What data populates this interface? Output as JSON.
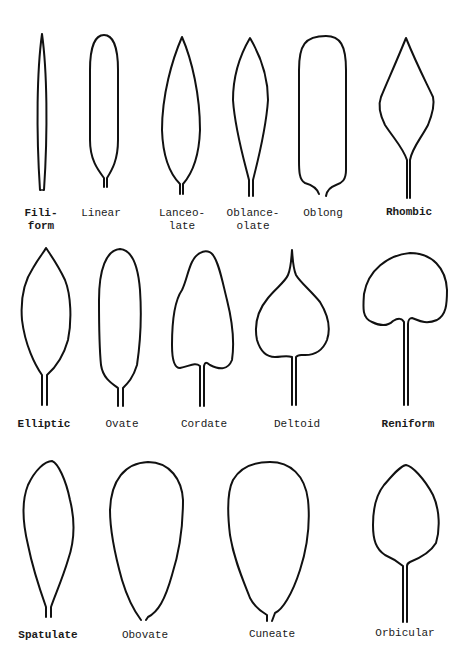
{
  "figure": {
    "rows": [
      {
        "leaves": [
          {
            "name": "Filiform",
            "label": "Fili-\nform"
          },
          {
            "name": "Linear",
            "label": "Linear"
          },
          {
            "name": "Lanceolate",
            "label": "Lanceo-\nlate"
          },
          {
            "name": "Oblanceolate",
            "label": "Oblance-\nolate"
          },
          {
            "name": "Oblong",
            "label": "Oblong"
          },
          {
            "name": "Rhombic",
            "label": "Rhombic"
          }
        ]
      },
      {
        "leaves": [
          {
            "name": "Elliptic",
            "label": "Elliptic"
          },
          {
            "name": "Ovate",
            "label": "Ovate"
          },
          {
            "name": "Cordate",
            "label": "Cordate"
          },
          {
            "name": "Deltoid",
            "label": "Deltoid"
          },
          {
            "name": "Reniform",
            "label": "Reniform"
          }
        ]
      },
      {
        "leaves": [
          {
            "name": "Spatulate",
            "label": "Spatulate"
          },
          {
            "name": "Obovate",
            "label": "Obovate"
          },
          {
            "name": "Cuneate",
            "label": "Cuneate"
          },
          {
            "name": "Orbicular",
            "label": "Orbicular"
          }
        ]
      }
    ],
    "stroke_color": "#111111",
    "background": "#ffffff"
  }
}
